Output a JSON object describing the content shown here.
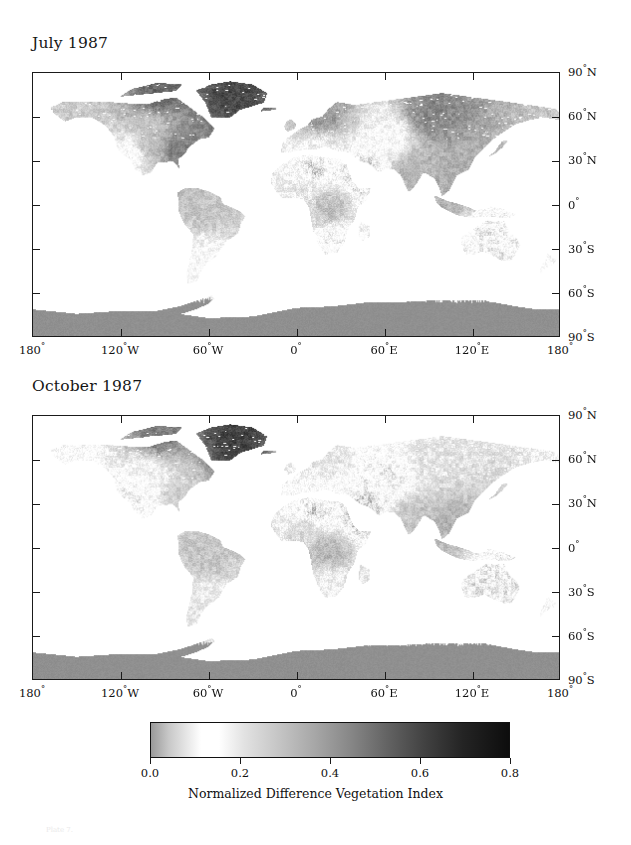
{
  "figure": {
    "caption_faint": "Plate 7.",
    "panels": [
      {
        "id": "july",
        "title": "July 1987"
      },
      {
        "id": "october",
        "title": "October 1987"
      }
    ],
    "latitude_labels": [
      "90",
      "60",
      "30",
      "0",
      "30",
      "60",
      "90"
    ],
    "latitude_hemis": [
      "N",
      "N",
      "N",
      "",
      "S",
      "S",
      "S"
    ],
    "longitude_labels": [
      "180",
      "120",
      "60",
      "0",
      "60",
      "120",
      "180"
    ],
    "longitude_hemis": [
      "",
      "W",
      "W",
      "",
      "E",
      "E",
      ""
    ]
  },
  "colorbar": {
    "caption": "Normalized Difference Vegetation Index",
    "ticks": [
      "0.0",
      "0.2",
      "0.4",
      "0.6",
      "0.8"
    ],
    "vmin": 0.0,
    "vmax": 0.8,
    "low_color": "#9a9a9a",
    "mid_color": "#ffffff",
    "high_color": "#0d0d0d"
  },
  "chart_data": {
    "type": "heatmap",
    "title": "Normalized Difference Vegetation Index",
    "subtitle": "Global NDVI maps, July 1987 and October 1987",
    "xlabel": "Longitude",
    "ylabel": "Latitude",
    "xlim": [
      -180,
      180
    ],
    "ylim": [
      -90,
      90
    ],
    "xticks": [
      -180,
      -120,
      -60,
      0,
      60,
      120,
      180
    ],
    "xticklabels": [
      "180°",
      "120°W",
      "60°W",
      "0°",
      "60°E",
      "120°E",
      "180°"
    ],
    "yticks": [
      90,
      60,
      30,
      0,
      -30,
      -60,
      -90
    ],
    "yticklabels": [
      "90°N",
      "60°N",
      "30°N",
      "0°",
      "30°S",
      "60°S",
      "90°S"
    ],
    "grid": false,
    "projection": "equirectangular",
    "colorbar": {
      "label": "Normalized Difference Vegetation Index",
      "range": [
        0.0,
        0.8
      ],
      "ticks": [
        0.0,
        0.2,
        0.4,
        0.6,
        0.8
      ],
      "orientation": "horizontal",
      "position": "bottom",
      "colormap": "grayscale: light-gray at 0.0, white near 0.15, darkening to near-black at 0.8"
    },
    "panels": [
      {
        "name": "July 1987",
        "regions": [
          {
            "region": "Greenland ice sheet",
            "lon": -42,
            "lat": 74,
            "ndvi": 0.62
          },
          {
            "region": "Canadian Arctic archipelago",
            "lon": -95,
            "lat": 74,
            "ndvi": 0.55
          },
          {
            "region": "Alaska / Yukon",
            "lon": -150,
            "lat": 64,
            "ndvi": 0.28
          },
          {
            "region": "Boreal Canada",
            "lon": -100,
            "lat": 55,
            "ndvi": 0.3
          },
          {
            "region": "Eastern United States",
            "lon": -82,
            "lat": 38,
            "ndvi": 0.48
          },
          {
            "region": "US Great Plains",
            "lon": -100,
            "lat": 40,
            "ndvi": 0.32
          },
          {
            "region": "US Southwest desert",
            "lon": -112,
            "lat": 35,
            "ndvi": 0.13
          },
          {
            "region": "Amazon basin",
            "lon": -62,
            "lat": -4,
            "ndvi": 0.3
          },
          {
            "region": "Southern South America",
            "lon": -64,
            "lat": -35,
            "ndvi": 0.16
          },
          {
            "region": "Sahara desert",
            "lon": 12,
            "lat": 24,
            "ndvi": 0.05
          },
          {
            "region": "Sahel",
            "lon": 8,
            "lat": 14,
            "ndvi": 0.22
          },
          {
            "region": "Congo basin",
            "lon": 22,
            "lat": -2,
            "ndvi": 0.32
          },
          {
            "region": "Southern Africa",
            "lon": 24,
            "lat": -24,
            "ndvi": 0.11
          },
          {
            "region": "Northern Europe",
            "lon": 18,
            "lat": 58,
            "ndvi": 0.42
          },
          {
            "region": "Mediterranean basin",
            "lon": 16,
            "lat": 40,
            "ndvi": 0.18
          },
          {
            "region": "Arabian peninsula",
            "lon": 46,
            "lat": 22,
            "ndvi": 0.05
          },
          {
            "region": "Siberian taiga",
            "lon": 92,
            "lat": 62,
            "ndvi": 0.46
          },
          {
            "region": "Central Asia steppe",
            "lon": 64,
            "lat": 46,
            "ndvi": 0.16
          },
          {
            "region": "India monsoon belt",
            "lon": 79,
            "lat": 22,
            "ndvi": 0.34
          },
          {
            "region": "Southeast Asia",
            "lon": 104,
            "lat": 14,
            "ndvi": 0.36
          },
          {
            "region": "Australia interior",
            "lon": 132,
            "lat": -24,
            "ndvi": 0.1
          },
          {
            "region": "Antarctica",
            "lon": 0,
            "lat": -82,
            "ndvi": 0.44
          }
        ]
      },
      {
        "name": "October 1987",
        "regions": [
          {
            "region": "Greenland ice sheet",
            "lon": -42,
            "lat": 74,
            "ndvi": 0.64
          },
          {
            "region": "Canadian Arctic archipelago",
            "lon": -95,
            "lat": 74,
            "ndvi": 0.5
          },
          {
            "region": "Alaska / Yukon",
            "lon": -150,
            "lat": 64,
            "ndvi": 0.16
          },
          {
            "region": "Boreal Canada",
            "lon": -100,
            "lat": 55,
            "ndvi": 0.18
          },
          {
            "region": "Eastern United States",
            "lon": -82,
            "lat": 38,
            "ndvi": 0.28
          },
          {
            "region": "US Great Plains",
            "lon": -100,
            "lat": 40,
            "ndvi": 0.16
          },
          {
            "region": "US Southwest desert",
            "lon": -112,
            "lat": 35,
            "ndvi": 0.1
          },
          {
            "region": "Amazon basin",
            "lon": -62,
            "lat": -4,
            "ndvi": 0.3
          },
          {
            "region": "Southern South America",
            "lon": -64,
            "lat": -35,
            "ndvi": 0.2
          },
          {
            "region": "Sahara desert",
            "lon": 12,
            "lat": 24,
            "ndvi": 0.05
          },
          {
            "region": "Sahel",
            "lon": 8,
            "lat": 14,
            "ndvi": 0.26
          },
          {
            "region": "Congo basin",
            "lon": 22,
            "lat": -2,
            "ndvi": 0.34
          },
          {
            "region": "Southern Africa",
            "lon": 24,
            "lat": -24,
            "ndvi": 0.18
          },
          {
            "region": "Northern Europe",
            "lon": 18,
            "lat": 58,
            "ndvi": 0.22
          },
          {
            "region": "Mediterranean basin",
            "lon": 16,
            "lat": 40,
            "ndvi": 0.14
          },
          {
            "region": "Arabian peninsula",
            "lon": 46,
            "lat": 22,
            "ndvi": 0.04
          },
          {
            "region": "Siberian taiga",
            "lon": 92,
            "lat": 62,
            "ndvi": 0.22
          },
          {
            "region": "Central Asia steppe",
            "lon": 64,
            "lat": 46,
            "ndvi": 0.1
          },
          {
            "region": "India monsoon belt",
            "lon": 79,
            "lat": 22,
            "ndvi": 0.3
          },
          {
            "region": "Southeast Asia",
            "lon": 104,
            "lat": 14,
            "ndvi": 0.34
          },
          {
            "region": "Australia interior",
            "lon": 132,
            "lat": -24,
            "ndvi": 0.09
          },
          {
            "region": "Antarctica",
            "lon": 0,
            "lat": -82,
            "ndvi": 0.44
          }
        ]
      }
    ]
  }
}
